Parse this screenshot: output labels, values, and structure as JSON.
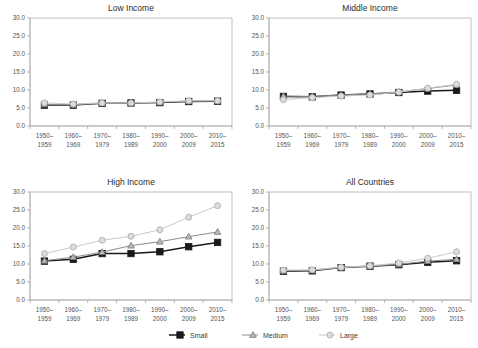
{
  "figure": {
    "panel_titles": {
      "low": "Low Income",
      "middle": "Middle Income",
      "high": "High Income",
      "all": "All Countries"
    }
  },
  "legend": {
    "position": "bottom-center",
    "entries": [
      {
        "label": "Small",
        "marker": "filled-square-marker",
        "color": "#1a1a1a"
      },
      {
        "label": "Medium",
        "marker": "triangle-marker",
        "color": "#8c8c8c"
      },
      {
        "label": "Large",
        "marker": "circle-marker",
        "color": "#c4c4c4"
      }
    ]
  },
  "axis": {
    "y_ticks": [
      "0.0",
      "5.0",
      "10.0",
      "15.0",
      "20.0",
      "25.0",
      "30.0"
    ],
    "x_tick_lines": [
      [
        "1950–",
        "1959"
      ],
      [
        "1960–",
        "1969"
      ],
      [
        "1970–",
        "1979"
      ],
      [
        "1980–",
        "1989"
      ],
      [
        "1990–",
        "2000"
      ],
      [
        "2000–",
        "2009"
      ],
      [
        "2010–",
        "2015"
      ]
    ]
  },
  "chart_data": [
    {
      "type": "line",
      "title": "Low Income",
      "xlabel": "",
      "ylabel": "",
      "ylim": [
        0,
        30
      ],
      "yticks": [
        0,
        5,
        10,
        15,
        20,
        25,
        30
      ],
      "grid": false,
      "legend": "bottom",
      "categories": [
        "1950–1959",
        "1960–1969",
        "1970–1979",
        "1980–1989",
        "1990–2000",
        "2000–2009",
        "2010–2015"
      ],
      "series": [
        {
          "name": "Small",
          "values": [
            5.8,
            5.8,
            6.3,
            6.4,
            6.5,
            6.8,
            6.9
          ]
        },
        {
          "name": "Medium",
          "values": [
            6.0,
            5.9,
            6.3,
            6.4,
            6.6,
            6.9,
            7.0
          ]
        },
        {
          "name": "Large",
          "values": [
            6.4,
            6.1,
            6.4,
            6.4,
            6.7,
            7.0,
            7.0
          ]
        }
      ]
    },
    {
      "type": "line",
      "title": "Middle Income",
      "xlabel": "",
      "ylabel": "",
      "ylim": [
        0,
        30
      ],
      "yticks": [
        0,
        5,
        10,
        15,
        20,
        25,
        30
      ],
      "grid": false,
      "legend": "bottom",
      "categories": [
        "1950–1959",
        "1960–1969",
        "1970–1979",
        "1980–1989",
        "1990–2000",
        "2000–2009",
        "2010–2015"
      ],
      "series": [
        {
          "name": "Small",
          "values": [
            8.2,
            8.1,
            8.6,
            8.9,
            9.3,
            9.7,
            9.9
          ]
        },
        {
          "name": "Medium",
          "values": [
            8.3,
            8.2,
            8.6,
            8.9,
            9.5,
            10.4,
            11.4
          ]
        },
        {
          "name": "Large",
          "values": [
            7.3,
            7.9,
            8.3,
            8.6,
            9.4,
            10.5,
            11.6
          ]
        }
      ]
    },
    {
      "type": "line",
      "title": "High Income",
      "xlabel": "",
      "ylabel": "",
      "ylim": [
        0,
        30
      ],
      "yticks": [
        0,
        5,
        10,
        15,
        20,
        25,
        30
      ],
      "grid": false,
      "legend": "bottom",
      "categories": [
        "1950–1959",
        "1960–1969",
        "1970–1979",
        "1980–1989",
        "1990–2000",
        "2000–2009",
        "2010–2015"
      ],
      "series": [
        {
          "name": "Small",
          "values": [
            10.8,
            11.3,
            12.9,
            12.9,
            13.4,
            14.8,
            16.0
          ]
        },
        {
          "name": "Medium",
          "values": [
            10.9,
            11.9,
            13.3,
            15.1,
            16.2,
            17.6,
            18.9
          ]
        },
        {
          "name": "Large",
          "values": [
            12.9,
            14.7,
            16.6,
            17.7,
            19.5,
            23.0,
            26.2
          ]
        }
      ]
    },
    {
      "type": "line",
      "title": "All Countries",
      "xlabel": "",
      "ylabel": "",
      "ylim": [
        0,
        30
      ],
      "yticks": [
        0,
        5,
        10,
        15,
        20,
        25,
        30
      ],
      "grid": false,
      "legend": "bottom",
      "categories": [
        "1950–1959",
        "1960–1969",
        "1970–1979",
        "1980–1989",
        "1990–2000",
        "2000–2009",
        "2010–2015"
      ],
      "series": [
        {
          "name": "Small",
          "values": [
            8.0,
            8.1,
            9.0,
            9.4,
            9.8,
            10.5,
            10.9
          ]
        },
        {
          "name": "Medium",
          "values": [
            8.1,
            8.2,
            9.0,
            9.4,
            9.9,
            10.8,
            11.3
          ]
        },
        {
          "name": "Large",
          "values": [
            8.3,
            8.4,
            9.1,
            9.5,
            10.3,
            11.6,
            13.4
          ]
        }
      ]
    }
  ]
}
